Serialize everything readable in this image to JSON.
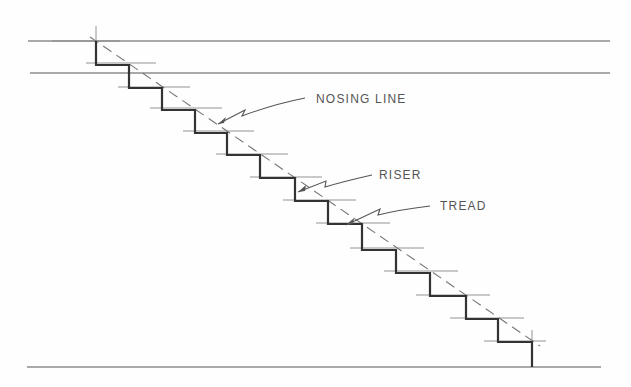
{
  "diagram": {
    "labels": {
      "nosing_line": "NOSING LINE",
      "riser": "RISER",
      "tread": "TREAD"
    },
    "colors": {
      "line": "#444444",
      "stair": "#333333",
      "dash": "#777777",
      "text": "#555555"
    }
  }
}
